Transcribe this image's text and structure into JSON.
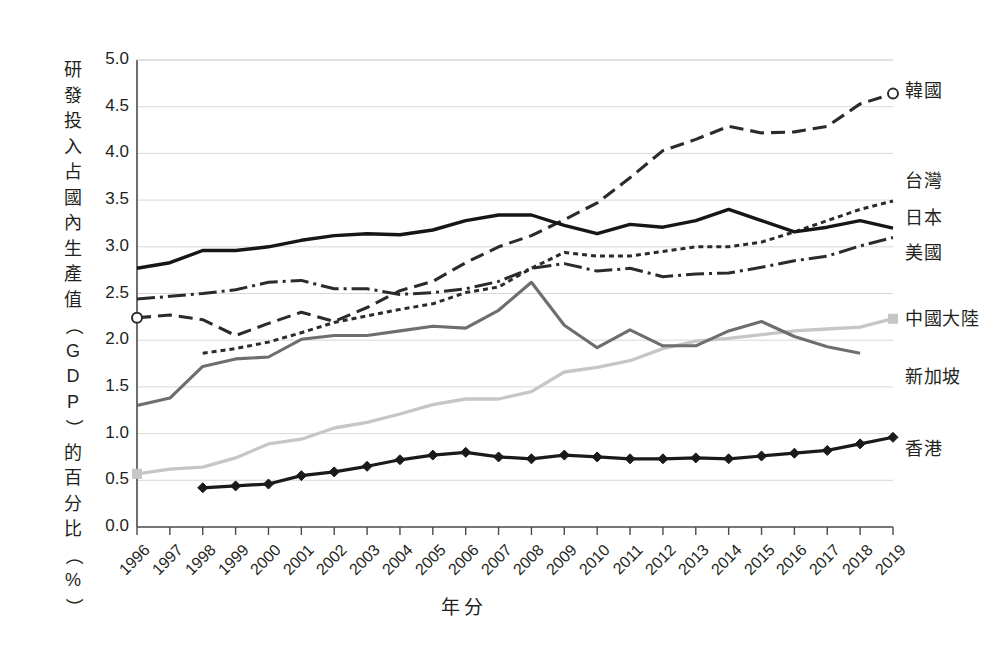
{
  "chart_data": {
    "type": "line",
    "title": "",
    "xlabel": "年分",
    "ylabel": "研發投入占國內生產值（GDP）的百分比（%）",
    "ylabel_chars": [
      "研",
      "發",
      "投",
      "入",
      "占",
      "國",
      "內",
      "生",
      "產",
      "值",
      "（",
      "G",
      "D",
      "P",
      "）",
      "的",
      "百",
      "分",
      "比",
      "（",
      "%",
      "）"
    ],
    "x": [
      1996,
      1997,
      1998,
      1999,
      2000,
      2001,
      2002,
      2003,
      2004,
      2005,
      2006,
      2007,
      2008,
      2009,
      2010,
      2011,
      2012,
      2013,
      2014,
      2015,
      2016,
      2017,
      2018,
      2019
    ],
    "categories": [
      "1996",
      "1997",
      "1998",
      "1999",
      "2000",
      "2001",
      "2002",
      "2003",
      "2004",
      "2005",
      "2006",
      "2007",
      "2008",
      "2009",
      "2010",
      "2011",
      "2012",
      "2013",
      "2014",
      "2015",
      "2016",
      "2017",
      "2018",
      "2019"
    ],
    "xlim": [
      1996,
      2019
    ],
    "ylim": [
      0.0,
      5.0
    ],
    "yticks": [
      0.0,
      0.5,
      1.0,
      1.5,
      2.0,
      2.5,
      3.0,
      3.5,
      4.0,
      4.5,
      5.0
    ],
    "ytick_labels": [
      "0.0",
      "0.5",
      "1.0",
      "1.5",
      "2.0",
      "2.5",
      "3.0",
      "3.5",
      "4.0",
      "4.5",
      "5.0"
    ],
    "grid": true,
    "grid_axis": "y",
    "legend_position": "right-inline",
    "series": [
      {
        "name": "韓國",
        "color": "#2b2b2b",
        "style": "dashed",
        "dasharray": "14,7",
        "width": 3.1,
        "marker": "open-circle",
        "marker_years": [
          1996,
          2019
        ],
        "label_x": 905,
        "label_y": 88,
        "values": [
          2.24,
          2.27,
          2.22,
          2.05,
          2.18,
          2.3,
          2.2,
          2.35,
          2.53,
          2.63,
          2.83,
          3.0,
          3.12,
          3.29,
          3.47,
          3.74,
          4.03,
          4.15,
          4.29,
          4.22,
          4.23,
          4.29,
          4.53,
          4.64
        ]
      },
      {
        "name": "台灣",
        "color": "#2b2b2b",
        "style": "dotted-dense",
        "dasharray": "5,4",
        "width": 3.0,
        "marker": "none",
        "marker_years": [],
        "label_x": 905,
        "label_y": 178,
        "values": [
          null,
          null,
          1.86,
          1.91,
          1.98,
          2.08,
          2.19,
          2.26,
          2.33,
          2.39,
          2.51,
          2.57,
          2.77,
          2.94,
          2.9,
          2.9,
          2.95,
          3.0,
          3.0,
          3.05,
          3.16,
          3.28,
          3.4,
          3.49
        ]
      },
      {
        "name": "日本",
        "color": "#161616",
        "style": "solid",
        "dasharray": "",
        "width": 3.4,
        "marker": "none",
        "marker_years": [],
        "label_x": 905,
        "label_y": 215,
        "values": [
          2.77,
          2.83,
          2.96,
          2.96,
          3.0,
          3.07,
          3.12,
          3.14,
          3.13,
          3.18,
          3.28,
          3.34,
          3.34,
          3.23,
          3.14,
          3.24,
          3.21,
          3.28,
          3.4,
          3.28,
          3.16,
          3.21,
          3.28,
          3.2
        ]
      },
      {
        "name": "美國",
        "color": "#2b2b2b",
        "style": "dash-dot",
        "dasharray": "18,5,3,5",
        "width": 3.0,
        "marker": "none",
        "marker_years": [],
        "label_x": 905,
        "label_y": 250,
        "values": [
          2.44,
          2.47,
          2.5,
          2.54,
          2.62,
          2.64,
          2.55,
          2.55,
          2.49,
          2.51,
          2.55,
          2.63,
          2.77,
          2.82,
          2.74,
          2.77,
          2.68,
          2.71,
          2.72,
          2.78,
          2.85,
          2.9,
          3.01,
          3.1
        ]
      },
      {
        "name": "中國大陸",
        "color": "#c6c6c6",
        "style": "solid",
        "dasharray": "",
        "width": 3.3,
        "marker": "square",
        "marker_years": [
          1996,
          2019
        ],
        "label_x": 905,
        "label_y": 316,
        "values": [
          0.57,
          0.62,
          0.64,
          0.74,
          0.89,
          0.94,
          1.06,
          1.12,
          1.21,
          1.31,
          1.37,
          1.37,
          1.45,
          1.66,
          1.71,
          1.78,
          1.91,
          1.99,
          2.02,
          2.06,
          2.1,
          2.12,
          2.14,
          2.23
        ]
      },
      {
        "name": "新加坡",
        "color": "#6e6e6e",
        "style": "solid",
        "dasharray": "",
        "width": 3.1,
        "marker": "none",
        "marker_years": [],
        "label_x": 905,
        "label_y": 374,
        "values": [
          1.3,
          1.38,
          1.72,
          1.8,
          1.82,
          2.01,
          2.05,
          2.05,
          2.1,
          2.15,
          2.13,
          2.32,
          2.62,
          2.16,
          1.92,
          2.11,
          1.94,
          1.94,
          2.1,
          2.2,
          2.04,
          1.93,
          1.86,
          null
        ]
      },
      {
        "name": "香港",
        "color": "#1a1a1a",
        "style": "solid",
        "dasharray": "",
        "width": 3.2,
        "marker": "filled-diamond",
        "marker_years": [
          1998,
          1999,
          2000,
          2001,
          2002,
          2003,
          2004,
          2005,
          2006,
          2007,
          2008,
          2009,
          2010,
          2011,
          2012,
          2013,
          2014,
          2015,
          2016,
          2017,
          2018,
          2019
        ],
        "label_x": 905,
        "label_y": 446,
        "values": [
          null,
          null,
          0.42,
          0.44,
          0.46,
          0.55,
          0.59,
          0.65,
          0.72,
          0.77,
          0.8,
          0.75,
          0.73,
          0.77,
          0.75,
          0.73,
          0.73,
          0.74,
          0.73,
          0.76,
          0.79,
          0.82,
          0.89,
          0.96
        ]
      }
    ]
  }
}
